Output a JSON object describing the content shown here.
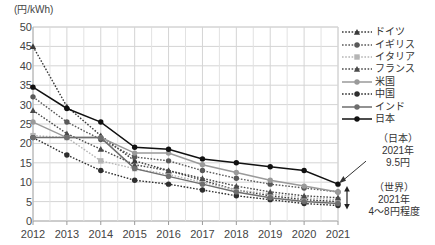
{
  "chart_data": {
    "type": "line",
    "title": "",
    "subtitle": "",
    "xlabel": "",
    "ylabel": "(円/kWh)",
    "yunit_label": "(円/kWh)",
    "categories": [
      "2012",
      "2013",
      "2014",
      "2015",
      "2016",
      "2017",
      "2018",
      "2019",
      "2020",
      "2021"
    ],
    "x": [
      2012,
      2013,
      2014,
      2015,
      2016,
      2017,
      2018,
      2019,
      2020,
      2021
    ],
    "ylim": [
      0,
      50
    ],
    "yticks": [
      0,
      5,
      10,
      15,
      20,
      25,
      30,
      35,
      40,
      45,
      50
    ],
    "grid": true,
    "legend_position": "right",
    "series": [
      {
        "name": "ドイツ",
        "marker": "triangle",
        "line_style": "dotted",
        "color": "#3a3a3a",
        "values": [
          45.0,
          29.5,
          22.0,
          15.5,
          13.0,
          10.5,
          8.0,
          6.5,
          5.5,
          5.0
        ]
      },
      {
        "name": "イギリス",
        "marker": "circle",
        "line_style": "dotted",
        "color": "#595959",
        "values": [
          32.0,
          25.5,
          21.0,
          16.5,
          15.5,
          13.0,
          11.0,
          9.5,
          8.5,
          7.5
        ]
      },
      {
        "name": "イタリア",
        "marker": "square",
        "line_style": "dotted",
        "color": "#b5b5b5",
        "values": [
          22.0,
          21.5,
          15.5,
          13.5,
          12.0,
          10.0,
          8.0,
          7.0,
          6.0,
          5.5
        ]
      },
      {
        "name": "フランス",
        "marker": "triangle",
        "line_style": "dotted",
        "color": "#4a4a4a",
        "values": [
          28.5,
          22.5,
          18.5,
          14.5,
          13.0,
          11.0,
          9.0,
          7.5,
          6.5,
          6.0
        ]
      },
      {
        "name": "米国",
        "marker": "circle",
        "line_style": "solid",
        "color": "#9a9a9a",
        "values": [
          25.5,
          21.5,
          21.5,
          17.5,
          17.5,
          14.5,
          12.5,
          10.5,
          9.0,
          7.5
        ]
      },
      {
        "name": "中国",
        "marker": "circle",
        "line_style": "dotted",
        "color": "#2e2e2e",
        "values": [
          21.5,
          17.0,
          13.0,
          10.5,
          9.5,
          8.0,
          6.5,
          5.5,
          4.5,
          4.0
        ]
      },
      {
        "name": "インド",
        "marker": "circle",
        "line_style": "solid",
        "color": "#6e6e6e",
        "values": [
          21.5,
          21.5,
          21.5,
          13.5,
          11.5,
          9.5,
          7.5,
          6.0,
          5.0,
          4.5
        ]
      },
      {
        "name": "日本",
        "marker": "circle",
        "line_style": "solid",
        "color": "#111111",
        "values": [
          34.5,
          29.0,
          25.5,
          19.0,
          18.5,
          16.0,
          15.0,
          14.0,
          13.0,
          9.5
        ]
      }
    ],
    "annotations": [
      {
        "id": "japan-2021",
        "lines": [
          "（日本）",
          "2021年",
          "9.5円"
        ],
        "points_to": {
          "x": 2021,
          "y": 9.5
        }
      },
      {
        "id": "world-2021",
        "lines": [
          "（世界）",
          "2021年",
          "4〜8円程度"
        ],
        "range": [
          4,
          8
        ]
      }
    ]
  },
  "legend": {
    "items": [
      {
        "label": "ドイツ"
      },
      {
        "label": "イギリス"
      },
      {
        "label": "イタリア"
      },
      {
        "label": "フランス"
      },
      {
        "label": "米国"
      },
      {
        "label": "中国"
      },
      {
        "label": "インド"
      },
      {
        "label": "日本"
      }
    ]
  },
  "annotation_japan": {
    "line1": "（日本）",
    "line2": "2021年",
    "line3": "9.5円"
  },
  "annotation_world": {
    "line1": "（世界）",
    "line2": "2021年",
    "line3": "4〜8円程度"
  }
}
